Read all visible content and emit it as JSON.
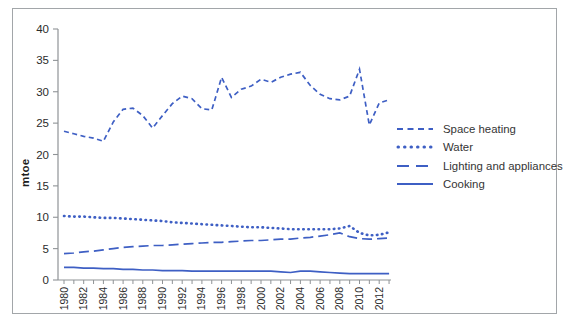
{
  "figure": {
    "frame_color": "#a2a6a9",
    "background": "#ffffff",
    "text_color": "#2b2b2b"
  },
  "chart_data": {
    "type": "line",
    "title": "",
    "xlabel": "",
    "ylabel": "mtoe",
    "ylim": [
      0,
      40
    ],
    "y_ticks": [
      0,
      5,
      10,
      15,
      20,
      25,
      30,
      35,
      40
    ],
    "x_tick_labels": [
      "1980",
      "1982",
      "1984",
      "1986",
      "1988",
      "1990",
      "1992",
      "1994",
      "1996",
      "1998",
      "2000",
      "2002",
      "2004",
      "2006",
      "2008",
      "2010",
      "2012"
    ],
    "x": [
      1980,
      1981,
      1982,
      1983,
      1984,
      1985,
      1986,
      1987,
      1988,
      1989,
      1990,
      1991,
      1992,
      1993,
      1994,
      1995,
      1996,
      1997,
      1998,
      1999,
      2000,
      2001,
      2002,
      2003,
      2004,
      2005,
      2006,
      2007,
      2008,
      2009,
      2010,
      2011,
      2012,
      2013
    ],
    "grid": false,
    "legend_position": "right",
    "line_color": "#3e5fc4",
    "series": [
      {
        "name": "Space heating",
        "style": "dashed",
        "values": [
          23.7,
          23.3,
          22.9,
          22.6,
          22.1,
          25.2,
          27.2,
          27.4,
          26.2,
          24.2,
          26.2,
          28.1,
          29.3,
          28.9,
          27.3,
          27.1,
          32.3,
          29.1,
          30.4,
          30.9,
          32.0,
          31.5,
          32.3,
          32.8,
          33.1,
          31.0,
          29.6,
          28.9,
          28.7,
          29.3,
          33.6,
          24.7,
          28.2,
          28.7
        ]
      },
      {
        "name": "Water",
        "style": "dotted",
        "values": [
          10.2,
          10.1,
          10.1,
          10.0,
          9.9,
          9.9,
          9.8,
          9.7,
          9.6,
          9.5,
          9.4,
          9.2,
          9.1,
          9.0,
          8.9,
          8.8,
          8.7,
          8.6,
          8.5,
          8.4,
          8.4,
          8.3,
          8.2,
          8.1,
          8.1,
          8.1,
          8.1,
          8.1,
          8.2,
          8.6,
          7.5,
          7.1,
          7.2,
          7.6
        ]
      },
      {
        "name": "Lighting and appliances",
        "style": "longdash",
        "values": [
          4.2,
          4.3,
          4.5,
          4.6,
          4.8,
          5.0,
          5.2,
          5.3,
          5.4,
          5.5,
          5.5,
          5.6,
          5.7,
          5.8,
          5.9,
          6.0,
          6.0,
          6.1,
          6.2,
          6.3,
          6.3,
          6.4,
          6.5,
          6.5,
          6.7,
          6.8,
          7.0,
          7.2,
          7.5,
          6.9,
          6.6,
          6.5,
          6.6,
          6.7
        ]
      },
      {
        "name": "Cooking",
        "style": "solid",
        "values": [
          2.0,
          2.0,
          1.9,
          1.9,
          1.8,
          1.8,
          1.7,
          1.7,
          1.6,
          1.6,
          1.5,
          1.5,
          1.5,
          1.4,
          1.4,
          1.4,
          1.4,
          1.4,
          1.4,
          1.4,
          1.4,
          1.4,
          1.3,
          1.2,
          1.4,
          1.4,
          1.3,
          1.2,
          1.1,
          1.0,
          1.0,
          1.0,
          1.0,
          1.0
        ]
      }
    ]
  }
}
